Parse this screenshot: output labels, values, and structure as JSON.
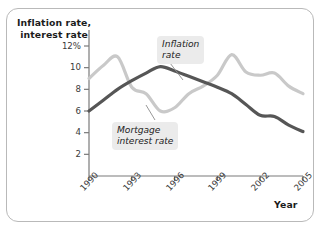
{
  "figure": {
    "y_axis_title_line1": "Inflation rate,",
    "y_axis_title_line2": "interest rate",
    "x_axis_title": "Year",
    "callout_inflation_line1": "Inflation",
    "callout_inflation_line2": "rate",
    "callout_mortgage_line1": "Mortgage",
    "callout_mortgage_line2": "interest rate",
    "colors": {
      "inflation_line": "#565656",
      "mortgage_line": "#c9c9c9",
      "axis": "#7a7a7a",
      "frame_border": "#b9b9b9",
      "callout_background": "#ebebeb",
      "text": "#1b1b1b"
    }
  },
  "chart_data": {
    "type": "line",
    "title": "",
    "xlabel": "Year",
    "ylabel": "Inflation rate, interest rate",
    "xlim": [
      1990,
      2005
    ],
    "ylim": [
      0,
      12
    ],
    "yticks": [
      2,
      4,
      6,
      8,
      10,
      12
    ],
    "ytick_labels": [
      "2",
      "4",
      "6",
      "8",
      "10",
      "12%"
    ],
    "xticks": [
      1990,
      1993,
      1996,
      1999,
      2002,
      2005
    ],
    "xtick_labels": [
      "1990",
      "1993",
      "1996",
      "1999",
      "2002",
      "2005"
    ],
    "grid": false,
    "legend": "annotated-callouts",
    "series": [
      {
        "name": "Inflation rate",
        "color": "#565656",
        "x": [
          1990,
          1991,
          1992,
          1993,
          1994,
          1995,
          1996,
          1997,
          1998,
          1999,
          2000,
          2001,
          2002,
          2003,
          2004,
          2005
        ],
        "values": [
          6.0,
          7.0,
          8.0,
          8.8,
          9.5,
          10.1,
          9.7,
          9.2,
          8.7,
          8.2,
          7.6,
          6.6,
          5.6,
          5.5,
          4.7,
          4.1
        ]
      },
      {
        "name": "Mortgage interest rate",
        "color": "#c9c9c9",
        "x": [
          1990,
          1991,
          1992,
          1993,
          1994,
          1995,
          1996,
          1997,
          1998,
          1999,
          2000,
          2001,
          2002,
          2003,
          2004,
          2005
        ],
        "values": [
          9.0,
          10.2,
          11.0,
          8.2,
          7.6,
          6.0,
          6.3,
          7.6,
          8.3,
          9.3,
          11.2,
          9.6,
          9.3,
          9.5,
          8.3,
          7.6
        ]
      }
    ]
  }
}
